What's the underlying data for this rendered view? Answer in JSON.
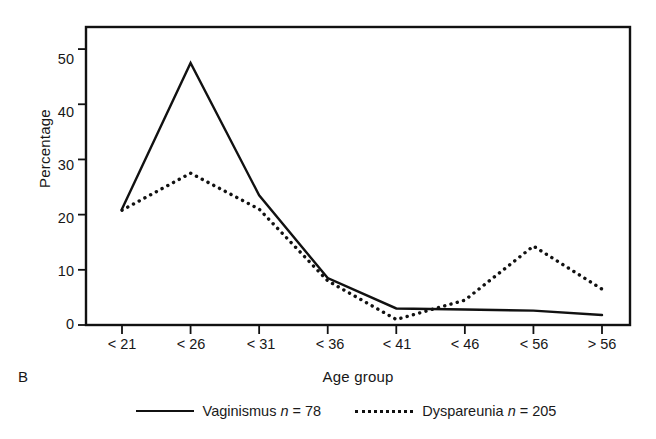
{
  "panel": {
    "letter": "B"
  },
  "legend": {
    "entries": [
      {
        "label_name": "Vaginismus",
        "label_n": "n",
        "label_value": "= 78",
        "style": "solid",
        "full": "Vaginismus n = 78"
      },
      {
        "label_name": "Dyspareunia",
        "label_n": "n",
        "label_value": "= 205",
        "style": "dotted",
        "full": "Dyspareunia n = 205"
      }
    ]
  },
  "chart_data": {
    "type": "line",
    "title": "",
    "subtitle": "",
    "xlabel": "Age group",
    "ylabel": "Percentage",
    "categories": [
      "< 21",
      "< 26",
      "< 31",
      "< 36",
      "< 41",
      "< 46",
      "< 56",
      "> 56"
    ],
    "ylim": [
      0,
      54
    ],
    "yticks": [
      0,
      10,
      20,
      30,
      40,
      50
    ],
    "ytick_labels": [
      "0",
      "10",
      "20",
      "30",
      "40",
      "50"
    ],
    "grid": false,
    "legend_position": "bottom",
    "series": [
      {
        "name": "Vaginismus n = 78",
        "short_name": "Vaginismus",
        "n": 78,
        "style": "solid",
        "color": "#111111",
        "values": [
          21,
          47.5,
          23.5,
          8.5,
          3,
          2.8,
          2.6,
          1.8
        ]
      },
      {
        "name": "Dyspareunia n = 205",
        "short_name": "Dyspareunia",
        "n": 205,
        "style": "dotted",
        "color": "#111111",
        "values": [
          20.8,
          27.5,
          21,
          8,
          1,
          4.5,
          14.3,
          6.5
        ]
      }
    ]
  }
}
